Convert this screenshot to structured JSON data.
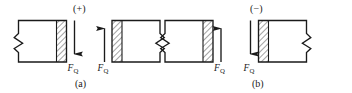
{
  "figure": {
    "width": 352,
    "height": 93,
    "background_color": "#ffffff",
    "stroke_color": "#1a1a1a",
    "hatch_color": "#555555",
    "type": "engineering-diagram"
  },
  "signs": {
    "positive": "(+)",
    "negative": "(−)"
  },
  "captions": {
    "panel_a": "(a)",
    "panel_b": "(b)"
  },
  "force": {
    "symbol": "F",
    "subscript": "Q",
    "full": "FQ"
  },
  "panels": [
    {
      "id": "panel-a",
      "sign": "(+)",
      "caption": "(a)",
      "blocks": [
        {
          "id": "block-a-left",
          "hatch_side": "right",
          "break_side": "left",
          "arrow_direction": "down",
          "arrow_side": "right",
          "force_label": "FQ"
        },
        {
          "id": "block-a-right",
          "hatch_side": "left",
          "break_side": "right",
          "arrow_direction": "up",
          "arrow_side": "left",
          "force_label": "FQ"
        }
      ]
    },
    {
      "id": "panel-b",
      "sign": "(−)",
      "caption": "(b)",
      "blocks": [
        {
          "id": "block-b-left",
          "hatch_side": "right",
          "break_side": "left",
          "arrow_direction": "up",
          "arrow_side": "right",
          "force_label": "FQ"
        },
        {
          "id": "block-b-right",
          "hatch_side": "left",
          "break_side": "right",
          "arrow_direction": "down",
          "arrow_side": "left",
          "force_label": "FQ"
        }
      ]
    }
  ]
}
